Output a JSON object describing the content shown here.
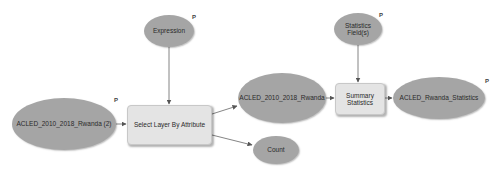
{
  "diagram": {
    "type": "ModelBuilder model",
    "nodes": [
      {
        "id": "expression",
        "kind": "variable",
        "label": "Expression",
        "parameter": "P"
      },
      {
        "id": "input_layer",
        "kind": "data",
        "label": "ACLED_2010_2018_Rwanda (2)",
        "parameter": "P"
      },
      {
        "id": "select_tool",
        "kind": "tool",
        "label": "Select Layer By Attribute"
      },
      {
        "id": "output_layer",
        "kind": "data",
        "label": "ACLED_2010_2018_Rwanda"
      },
      {
        "id": "count",
        "kind": "variable",
        "label": "Count"
      },
      {
        "id": "stats_fields",
        "kind": "variable",
        "label": "Statistics Field(s)",
        "parameter": "P"
      },
      {
        "id": "summary_tool",
        "kind": "tool",
        "label": "Summary\nStatistics"
      },
      {
        "id": "stats_output",
        "kind": "data",
        "label": "ACLED_Rwanda_Statistics",
        "parameter": "P"
      }
    ],
    "edges": [
      {
        "from": "expression",
        "to": "select_tool"
      },
      {
        "from": "input_layer",
        "to": "select_tool"
      },
      {
        "from": "select_tool",
        "to": "output_layer"
      },
      {
        "from": "select_tool",
        "to": "count"
      },
      {
        "from": "output_layer",
        "to": "summary_tool"
      },
      {
        "from": "stats_fields",
        "to": "summary_tool"
      },
      {
        "from": "summary_tool",
        "to": "stats_output"
      }
    ],
    "colors": {
      "ellipse_fill": "#a5a5a5",
      "tool_fill": "#e4e4e4",
      "connector": "#555555"
    }
  }
}
